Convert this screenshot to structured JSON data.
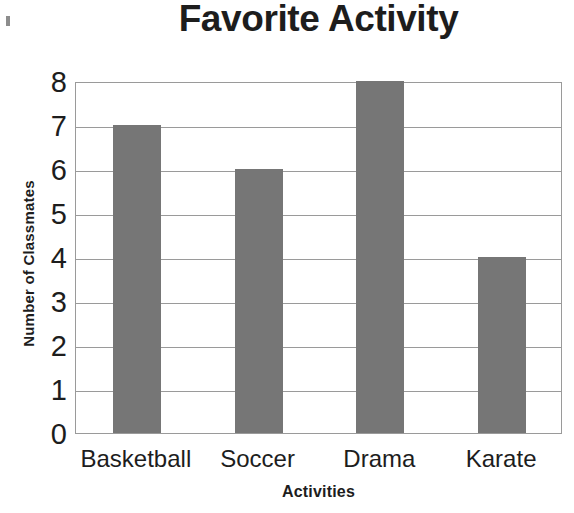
{
  "chart_data": {
    "type": "bar",
    "title": "Favorite Activity",
    "xlabel": "Activities",
    "ylabel": "Number of Classmates",
    "categories": [
      "Basketball",
      "Soccer",
      "Drama",
      "Karate"
    ],
    "values": [
      7,
      6,
      8,
      4
    ],
    "ylim": [
      0,
      8
    ],
    "ytick_labels": [
      "8",
      "7",
      "6",
      "5",
      "4",
      "3",
      "2",
      "1",
      "0"
    ],
    "ytick_values": [
      8,
      7,
      6,
      5,
      4,
      3,
      2,
      1,
      0
    ],
    "grid": true,
    "gridlines_axis": "y",
    "legend": false,
    "legend_position": "none",
    "series": [
      {
        "name": "Number of Classmates",
        "values": [
          7,
          6,
          8,
          4
        ],
        "color": "#767676"
      }
    ],
    "colors": {
      "bar_fill": "#767676",
      "grid_line": "#9a9a9a",
      "plot_border": "#9a9a9a",
      "text": "#1d1d1d",
      "background": "#ffffff"
    }
  }
}
